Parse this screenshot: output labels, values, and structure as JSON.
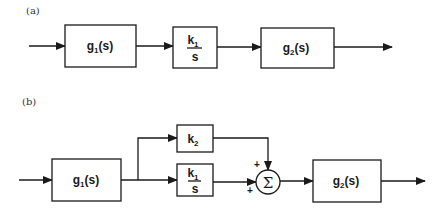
{
  "panels": {
    "a": {
      "label": "(a)",
      "blocks": [
        {
          "id": "g1",
          "name": "g",
          "sub": "1",
          "arg": "(s)"
        },
        {
          "id": "k1s",
          "num": "k",
          "num_sub": "1",
          "den": "s"
        },
        {
          "id": "g2",
          "name": "g",
          "sub": "2",
          "arg": "(s)"
        }
      ]
    },
    "b": {
      "label": "(b)",
      "blocks": [
        {
          "id": "g1",
          "name": "g",
          "sub": "1",
          "arg": "(s)"
        },
        {
          "id": "k2",
          "name": "k",
          "sub": "2"
        },
        {
          "id": "k1s",
          "num": "k",
          "num_sub": "1",
          "den": "s"
        },
        {
          "id": "g2",
          "name": "g",
          "sub": "2",
          "arg": "(s)"
        }
      ],
      "summer": {
        "symbol": "Σ",
        "sign_top": "+",
        "sign_left": "+"
      }
    }
  },
  "colors": {
    "line": "#1a1a1a",
    "background": "#ffffff"
  }
}
